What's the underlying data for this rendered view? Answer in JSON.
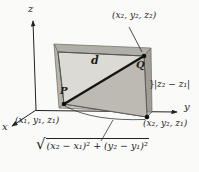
{
  "figure": {
    "background": "#fafaf8",
    "colors": {
      "box_front": "#dbdad5",
      "box_top": "#b0aea7",
      "box_left": "#b6b4ad",
      "box_right": "#9f9d96",
      "box_bottom": "#c2c0b9",
      "shaded_triangle": "#bcbab3",
      "line": "#1c1c1a"
    },
    "axes": {
      "x_label": "x",
      "y_label": "y",
      "z_label": "z"
    },
    "points": {
      "P": {
        "label": "P",
        "coords_label": "(x₁, y₁, z₁)"
      },
      "Q": {
        "label": "Q",
        "coords_label": "(x₂, y₂, z₂)"
      },
      "base": {
        "coords_label": "(x₂, y₂, z₁)"
      }
    },
    "segments": {
      "diagonal_label": "d",
      "vertical_brace": "}",
      "vertical_label": "|z₂ − z₁|",
      "horizontal_radical_sign": "√",
      "horizontal_radicand": "(x₂ − x₁)² + (y₂ − y₁)²"
    }
  }
}
